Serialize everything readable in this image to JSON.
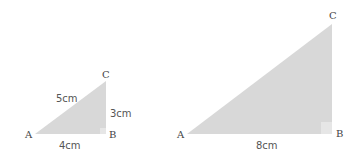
{
  "colors": {
    "triangle_fill": "#d8d8d8",
    "right_angle_fill": "#e6e6e6",
    "text": "#4a4a4a"
  },
  "small_triangle": {
    "vertices": {
      "A": "A",
      "B": "B",
      "C": "C"
    },
    "sides": {
      "hypotenuse": "5cm",
      "vertical": "3cm",
      "base": "4cm"
    }
  },
  "large_triangle": {
    "vertices": {
      "A": "A",
      "B": "B",
      "C": "C"
    },
    "sides": {
      "base": "8cm"
    }
  }
}
